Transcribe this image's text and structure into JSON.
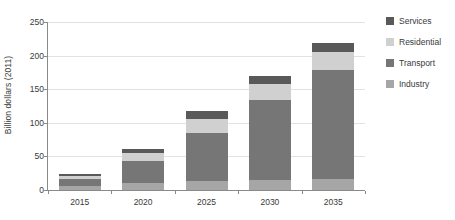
{
  "chart_data": {
    "type": "bar",
    "subtype": "stacked-vertical",
    "title": "",
    "xlabel": "",
    "ylabel": "Billion dollars (2011)",
    "categories": [
      "2015",
      "2020",
      "2025",
      "2030",
      "2035"
    ],
    "ylim": [
      0,
      250
    ],
    "yticks": [
      0,
      50,
      100,
      150,
      200,
      250
    ],
    "ytick_labels": [
      "0",
      "50",
      "100",
      "150",
      "200",
      "250"
    ],
    "grid": true,
    "grid_axis": "y",
    "legend_position": "right",
    "stack_order_bottom_to_top": [
      "Industry",
      "Transport",
      "Residential",
      "Services"
    ],
    "series": [
      {
        "name": "Industry",
        "color": "#a6a6a6",
        "values": [
          6,
          10,
          13,
          15,
          16
        ]
      },
      {
        "name": "Transport",
        "color": "#767676",
        "values": [
          11,
          33,
          72,
          119,
          163
        ]
      },
      {
        "name": "Residential",
        "color": "#d0d0d0",
        "values": [
          4,
          12,
          21,
          24,
          27
        ]
      },
      {
        "name": "Services",
        "color": "#595959",
        "values": [
          3,
          6,
          11,
          12,
          13
        ]
      }
    ],
    "totals": [
      24,
      61,
      117,
      170,
      219
    ]
  },
  "legend": {
    "items": [
      {
        "label": "Services",
        "color": "#595959"
      },
      {
        "label": "Residential",
        "color": "#d0d0d0"
      },
      {
        "label": "Transport",
        "color": "#767676"
      },
      {
        "label": "Industry",
        "color": "#a6a6a6"
      }
    ]
  },
  "colors": {
    "axis": "#8a8a8a",
    "grid": "#e2e2e2",
    "text": "#3a3a3a",
    "background": "#ffffff"
  }
}
